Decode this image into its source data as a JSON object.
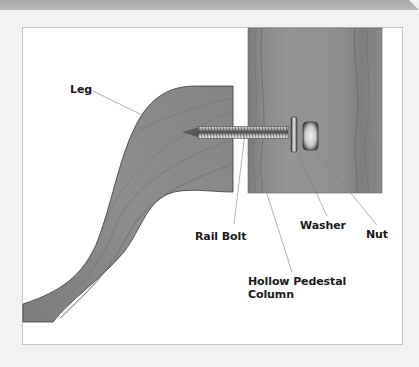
{
  "diagram": {
    "type": "exploded assembly illustration",
    "colors": {
      "background": "#f2f2f2",
      "top_band": "#b0b0b0",
      "frame_fill": "#ffffff",
      "frame_border": "#c4c4c4",
      "wood": "#8a8a8a",
      "wood_dark": "#6e6e6e",
      "metal_light": "#e0e0e0",
      "metal_dark": "#5a5a5a",
      "leader_line": "#7a7a7a",
      "label_text": "#1a1a1a"
    },
    "parts": [
      {
        "id": "leg",
        "label": "Leg"
      },
      {
        "id": "rail-bolt",
        "label": "Rail Bolt"
      },
      {
        "id": "hollow-pedestal-column",
        "label_line1": "Hollow Pedestal",
        "label_line2": "Column"
      },
      {
        "id": "washer",
        "label": "Washer"
      },
      {
        "id": "nut",
        "label": "Nut"
      }
    ]
  },
  "labels": {
    "leg": "Leg",
    "rail_bolt": "Rail Bolt",
    "washer": "Washer",
    "nut": "Nut",
    "column_line1": "Hollow Pedestal",
    "column_line2": "Column"
  }
}
